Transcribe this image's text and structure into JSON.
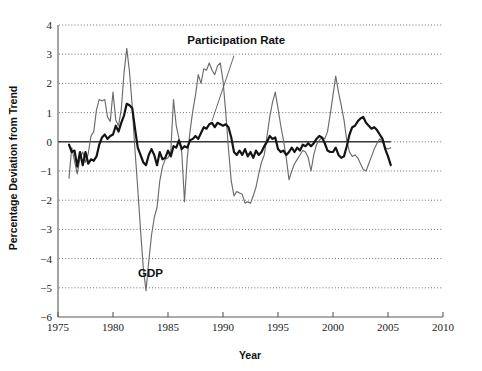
{
  "chart_data": {
    "type": "line",
    "title": "",
    "xlabel": "Year",
    "ylabel": "Percentage Deviation from Trend",
    "xlim": [
      1975,
      2010
    ],
    "ylim": [
      -6,
      4
    ],
    "grid": true,
    "legend_position": "inline-annotation",
    "x_ticks": [
      "1975",
      "1980",
      "1985",
      "1990",
      "1995",
      "2000",
      "2005",
      "2010"
    ],
    "x_tick_values": [
      1975,
      1980,
      1985,
      1990,
      1995,
      2000,
      2005,
      2010
    ],
    "y_ticks": [
      "4",
      "3",
      "2",
      "1",
      "0",
      "−1",
      "−2",
      "−3",
      "−4",
      "−5",
      "−6"
    ],
    "y_tick_values": [
      4,
      3,
      2,
      1,
      0,
      -1,
      -2,
      -3,
      -4,
      -5,
      -6
    ],
    "annotations": [
      {
        "name": "participation-rate-label",
        "text": "Participation Rate",
        "x": 1991.2,
        "y": 3.35
      },
      {
        "name": "gdp-label",
        "text": "GDP",
        "x": 1983.4,
        "y": -4.62
      }
    ],
    "series": [
      {
        "name": "GDP",
        "color": "#6b6b6b",
        "style": "thin",
        "x": [
          1976.0,
          1976.25,
          1976.5,
          1976.75,
          1977.0,
          1977.25,
          1977.5,
          1977.75,
          1978.0,
          1978.25,
          1978.5,
          1978.75,
          1979.0,
          1979.25,
          1979.5,
          1979.75,
          1980.0,
          1980.25,
          1980.5,
          1980.75,
          1981.0,
          1981.25,
          1981.5,
          1981.75,
          1982.0,
          1982.25,
          1982.5,
          1982.75,
          1983.0,
          1983.25,
          1983.5,
          1983.75,
          1984.0,
          1984.25,
          1984.5,
          1984.75,
          1985.0,
          1985.25,
          1985.5,
          1985.75,
          1986.0,
          1986.25,
          1986.5,
          1986.75,
          1987.0,
          1987.25,
          1987.5,
          1987.75,
          1988.0,
          1988.25,
          1988.5,
          1988.75,
          1989.0,
          1989.25,
          1989.5,
          1989.75,
          1990.0,
          1990.25,
          1990.5,
          1990.75,
          1991.0,
          1991.25,
          1991.5,
          1991.75,
          1992.0,
          1992.25,
          1992.5,
          1992.75,
          1993.0,
          1993.25,
          1993.5,
          1993.75,
          1994.0,
          1994.25,
          1994.5,
          1994.75,
          1995.0,
          1995.25,
          1995.5,
          1995.75,
          1996.0,
          1996.25,
          1996.5,
          1996.75,
          1997.0,
          1997.25,
          1997.5,
          1997.75,
          1998.0,
          1998.25,
          1998.5,
          1998.75,
          1999.0,
          1999.25,
          1999.5,
          1999.75,
          2000.0,
          2000.25,
          2000.5,
          2000.75,
          2001.0,
          2001.25,
          2001.5,
          2001.75,
          2002.0,
          2002.25,
          2002.5,
          2002.75,
          2003.0,
          2003.25,
          2003.5,
          2003.75,
          2004.0,
          2004.25,
          2004.5,
          2004.75,
          2005.0,
          2005.25
        ],
        "y": [
          -1.25,
          -0.2,
          -0.65,
          -1.1,
          -0.55,
          -0.35,
          -0.7,
          -0.4,
          0.2,
          0.35,
          1.1,
          1.45,
          1.4,
          1.45,
          0.85,
          0.7,
          1.7,
          0.75,
          0.55,
          1.1,
          2.35,
          3.2,
          2.4,
          1.2,
          -0.3,
          -1.6,
          -3.0,
          -4.3,
          -5.1,
          -4.1,
          -3.2,
          -2.6,
          -2.25,
          -1.35,
          -0.85,
          -0.6,
          -0.55,
          -0.35,
          1.45,
          0.55,
          0.1,
          -0.35,
          -2.05,
          -0.55,
          0.35,
          1.05,
          1.6,
          2.3,
          2.0,
          2.5,
          2.45,
          2.7,
          2.45,
          2.3,
          2.6,
          2.7,
          2.1,
          1.0,
          -0.25,
          -1.35,
          -1.85,
          -1.7,
          -1.75,
          -1.8,
          -2.1,
          -2.05,
          -2.1,
          -1.85,
          -1.55,
          -1.1,
          -0.7,
          -0.45,
          0.2,
          0.85,
          1.35,
          1.7,
          1.15,
          0.55,
          0.05,
          -0.55,
          -1.3,
          -1.0,
          -0.75,
          -0.6,
          -0.45,
          -0.3,
          -0.35,
          -0.55,
          -1.0,
          -0.45,
          -0.1,
          0.05,
          0.15,
          0.1,
          0.35,
          0.95,
          1.6,
          2.25,
          1.7,
          1.25,
          0.75,
          0.05,
          -0.35,
          -0.5,
          -0.45,
          -0.55,
          -0.75,
          -0.95,
          -1.0,
          -0.75,
          -0.5,
          -0.25,
          -0.05,
          0.1,
          0.0,
          -0.2,
          -0.25,
          -0.2
        ]
      },
      {
        "name": "Participation Rate",
        "color": "#141414",
        "style": "thick",
        "x": [
          1976.0,
          1976.25,
          1976.5,
          1976.75,
          1977.0,
          1977.25,
          1977.5,
          1977.75,
          1978.0,
          1978.25,
          1978.5,
          1978.75,
          1979.0,
          1979.25,
          1979.5,
          1979.75,
          1980.0,
          1980.25,
          1980.5,
          1980.75,
          1981.0,
          1981.25,
          1981.5,
          1981.75,
          1982.0,
          1982.25,
          1982.5,
          1982.75,
          1983.0,
          1983.25,
          1983.5,
          1983.75,
          1984.0,
          1984.25,
          1984.5,
          1984.75,
          1985.0,
          1985.25,
          1985.5,
          1985.75,
          1986.0,
          1986.25,
          1986.5,
          1986.75,
          1987.0,
          1987.25,
          1987.5,
          1987.75,
          1988.0,
          1988.25,
          1988.5,
          1988.75,
          1989.0,
          1989.25,
          1989.5,
          1989.75,
          1990.0,
          1990.25,
          1990.5,
          1990.75,
          1991.0,
          1991.25,
          1991.5,
          1991.75,
          1992.0,
          1992.25,
          1992.5,
          1992.75,
          1993.0,
          1993.25,
          1993.5,
          1993.75,
          1994.0,
          1994.25,
          1994.5,
          1994.75,
          1995.0,
          1995.25,
          1995.5,
          1995.75,
          1996.0,
          1996.25,
          1996.5,
          1996.75,
          1997.0,
          1997.25,
          1997.5,
          1997.75,
          1998.0,
          1998.25,
          1998.5,
          1998.75,
          1999.0,
          1999.25,
          1999.5,
          1999.75,
          2000.0,
          2000.25,
          2000.5,
          2000.75,
          2001.0,
          2001.25,
          2001.5,
          2001.75,
          2002.0,
          2002.25,
          2002.5,
          2002.75,
          2003.0,
          2003.25,
          2003.5,
          2003.75,
          2004.0,
          2004.25,
          2004.5,
          2004.75,
          2005.0,
          2005.25
        ],
        "y": [
          -0.1,
          -0.35,
          -0.3,
          -0.85,
          -0.35,
          -0.8,
          -0.35,
          -0.75,
          -0.6,
          -0.65,
          -0.5,
          -0.1,
          0.15,
          0.25,
          0.1,
          0.2,
          0.25,
          0.55,
          0.35,
          0.65,
          0.9,
          1.3,
          1.25,
          1.15,
          0.45,
          -0.2,
          -0.45,
          -0.7,
          -0.8,
          -0.45,
          -0.25,
          -0.45,
          -0.8,
          -0.35,
          -0.6,
          -0.55,
          -0.3,
          -0.5,
          -0.15,
          -0.2,
          0.05,
          -0.25,
          -0.15,
          -0.2,
          0.05,
          0.1,
          0.2,
          0.1,
          0.3,
          0.5,
          0.45,
          0.6,
          0.65,
          0.5,
          0.65,
          0.6,
          0.55,
          0.6,
          0.5,
          0.15,
          -0.35,
          -0.45,
          -0.3,
          -0.45,
          -0.25,
          -0.5,
          -0.35,
          -0.55,
          -0.3,
          -0.45,
          -0.35,
          -0.15,
          0.0,
          0.2,
          0.1,
          0.15,
          -0.25,
          -0.35,
          -0.3,
          -0.45,
          -0.35,
          -0.2,
          -0.35,
          -0.2,
          -0.3,
          -0.1,
          -0.15,
          -0.05,
          -0.15,
          -0.05,
          0.1,
          0.2,
          0.15,
          -0.05,
          -0.3,
          -0.35,
          -0.35,
          -0.2,
          -0.45,
          -0.55,
          -0.5,
          -0.15,
          0.25,
          0.5,
          0.55,
          0.7,
          0.8,
          0.85,
          0.65,
          0.55,
          0.45,
          0.5,
          0.4,
          0.25,
          0.1,
          -0.25,
          -0.5,
          -0.8
        ]
      }
    ]
  }
}
